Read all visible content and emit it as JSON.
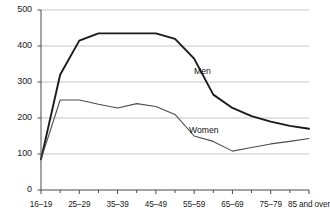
{
  "chart_data": {
    "type": "line",
    "title": "",
    "xlabel": "",
    "ylabel": "",
    "ylim": [
      0,
      500
    ],
    "ytick_values": [
      0,
      100,
      200,
      300,
      400,
      500
    ],
    "ytick_labels": [
      "0",
      "100",
      "200",
      "300",
      "400",
      "500"
    ],
    "grid": true,
    "legend_position": "inline-annotations",
    "categories": [
      "16–19",
      "20–24",
      "25–29",
      "30–34",
      "35–39",
      "40–44",
      "45–49",
      "50–54",
      "55–59",
      "60–64",
      "65–69",
      "70–74",
      "75–79",
      "80–84",
      "85 and over"
    ],
    "xtick_labels_shown": [
      "16–19",
      "25–29",
      "35–39",
      "45–49",
      "55–59",
      "65–69",
      "75–79",
      "85 and over"
    ],
    "series": [
      {
        "name": "Men",
        "color": "#1a1a1a",
        "values": [
          85,
          320,
          415,
          435,
          435,
          435,
          435,
          420,
          365,
          265,
          228,
          205,
          190,
          178,
          170
        ]
      },
      {
        "name": "Women",
        "color": "#4d4d4d",
        "values": [
          85,
          250,
          250,
          238,
          228,
          240,
          232,
          210,
          150,
          135,
          108,
          118,
          128,
          135,
          143
        ]
      }
    ],
    "annotations": [
      {
        "text": "Men",
        "x_px": 194,
        "y_px": 66
      },
      {
        "text": "Women",
        "x_px": 189,
        "y_px": 125
      }
    ]
  }
}
